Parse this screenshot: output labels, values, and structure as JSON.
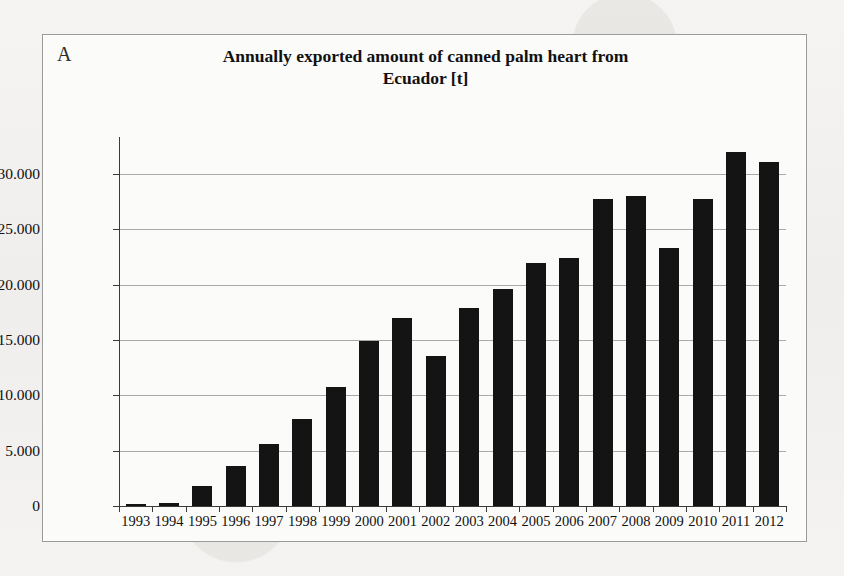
{
  "figure": {
    "panel_label": "A",
    "title_line1": "Annually exported amount of canned palm heart from",
    "title_line2": "Ecuador [t]",
    "colors": {
      "bar": "#141414",
      "gridline": "#8e8e8c",
      "axis": "#3a3a38",
      "frame": "#9a9a98",
      "plot_background": "#fbfbfa",
      "page_background": "#f3f2f0"
    }
  },
  "chart_data": {
    "type": "bar",
    "title": "Annually exported amount of canned palm heart from Ecuador [t]",
    "xlabel": "",
    "ylabel": "",
    "ylim": [
      0,
      33000
    ],
    "grid": true,
    "legend": false,
    "y_tick_labels": [
      "0",
      "5.000",
      "10.000",
      "15.000",
      "20.000",
      "25.000",
      "30.000"
    ],
    "y_tick_values": [
      0,
      5000,
      10000,
      15000,
      20000,
      25000,
      30000
    ],
    "categories": [
      "1993",
      "1994",
      "1995",
      "1996",
      "1997",
      "1998",
      "1999",
      "2000",
      "2001",
      "2002",
      "2003",
      "2004",
      "2005",
      "2006",
      "2007",
      "2008",
      "2009",
      "2010",
      "2011",
      "2012"
    ],
    "values": [
      150,
      300,
      1800,
      3600,
      5600,
      7900,
      10800,
      14900,
      17000,
      13600,
      17900,
      19600,
      22000,
      22400,
      27800,
      28000,
      23300,
      27800,
      32000,
      31100
    ],
    "units": "t"
  }
}
